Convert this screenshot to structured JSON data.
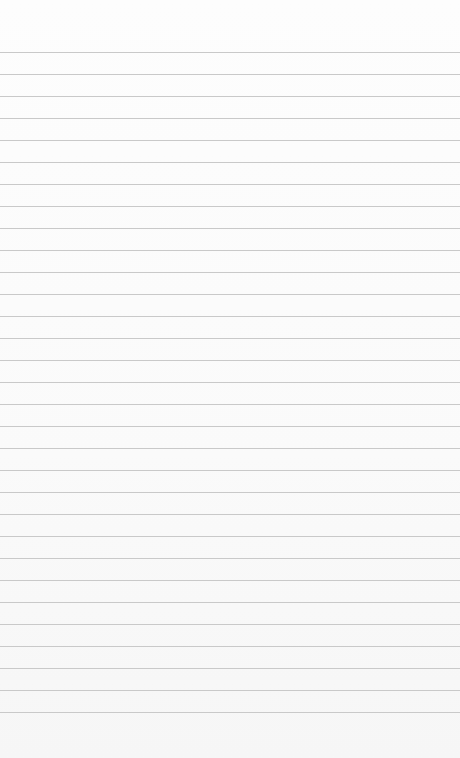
{
  "image": {
    "subject": "blank lined paper",
    "background_color": "#fbfbfb",
    "rule_color": "#c9c9c9",
    "rule_positions_y": [
      52,
      74,
      96,
      118,
      140,
      162,
      184,
      206,
      228,
      250,
      272,
      294,
      316,
      338,
      360,
      382,
      404,
      426,
      448,
      470,
      492,
      514,
      536,
      558,
      580,
      602,
      624,
      646,
      668,
      690,
      712
    ]
  }
}
